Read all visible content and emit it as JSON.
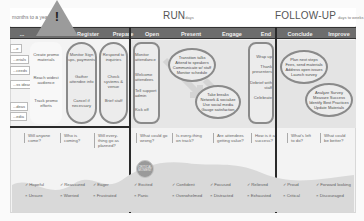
{
  "phases": {
    "plan": {
      "subtitle": "months to a year"
    },
    "run": {
      "title": "RUN",
      "subtitle": "days"
    },
    "followup": {
      "title": "FOLLOW-UP",
      "subtitle": "days to weeks"
    }
  },
  "warning": {
    "symbol": "!"
  },
  "columns": [
    {
      "label": "...",
      "x": 10
    },
    {
      "label": "Pr",
      "x": 40
    },
    {
      "label": "Register",
      "x": 86
    },
    {
      "label": "Prepare",
      "x": 98
    },
    {
      "label": "Open",
      "x": 140
    },
    {
      "label": "Present",
      "x": 172
    },
    {
      "label": "Engage",
      "x": 213
    },
    {
      "label": "End",
      "x": 255
    },
    {
      "label": "Conclude",
      "x": 283
    },
    {
      "label": "Improve",
      "x": 323
    }
  ],
  "left_items": [
    "...e",
    "...erials",
    "...ceeds",
    "...ss ideas",
    "...deas",
    "...edia"
  ],
  "promote_items": [
    "Create promo materials",
    "Reach widest audience",
    "Track promo efforts"
  ],
  "register_items": [
    "Monitor Sign ups, payments",
    "Gather attendee info",
    "Cancel if necessary"
  ],
  "prepare_items": [
    "Respond to inquiries",
    "Check systems & venue",
    "Brief staff"
  ],
  "open_items": [
    "Monitor attendance",
    "Welcome attendees",
    "Tell support admin",
    "Kick off"
  ],
  "present_oval": [
    "Transition talks",
    "Attend to speakers",
    "Communicate w/ staff",
    "Monitor schedule"
  ],
  "engage_oval": [
    "Take breaks",
    "Network & socialize",
    "Use social media",
    "Gauge satisfaction"
  ],
  "end_items": [
    "Wrap up",
    "Thank presenters",
    "Debrief with staff",
    "Celebrate"
  ],
  "conclude_oval": [
    "Plan next steps",
    "Fees, send materials",
    "Address open issues",
    "Launch survey"
  ],
  "improve_oval": [
    "Analyze Survey",
    "Measure Success",
    "Identify Best Practices",
    "Update Materials"
  ],
  "questions": [
    {
      "text": "Will anyone come?",
      "x": 24
    },
    {
      "text": "Who is coming?",
      "x": 60
    },
    {
      "text": "Will every-thing go as planned?",
      "x": 95
    },
    {
      "text": "What could go wrong?",
      "x": 137
    },
    {
      "text": "Is every-thing on track?",
      "x": 172
    },
    {
      "text": "Are attendees getting value?",
      "x": 213
    },
    {
      "text": "How is it a success?",
      "x": 250
    },
    {
      "text": "What's left to do?",
      "x": 287
    },
    {
      "text": "What could be better?",
      "x": 320
    }
  ],
  "badge": {
    "text": "CRITICAL MOMENT"
  },
  "emotions_positive": [
    {
      "text": "Hopeful",
      "x": 24
    },
    {
      "text": "Reassured",
      "x": 60
    },
    {
      "text": "Eager",
      "x": 95
    },
    {
      "text": "Excited",
      "x": 135
    },
    {
      "text": "Confident",
      "x": 172
    },
    {
      "text": "Focused",
      "x": 210
    },
    {
      "text": "Relieved",
      "x": 247
    },
    {
      "text": "Proud",
      "x": 283
    },
    {
      "text": "Forward looking",
      "x": 317
    }
  ],
  "emotions_negative": [
    {
      "text": "Unsure",
      "x": 24
    },
    {
      "text": "Worried",
      "x": 60
    },
    {
      "text": "Frustrated",
      "x": 95
    },
    {
      "text": "Panic",
      "x": 135
    },
    {
      "text": "Overwhelmed",
      "x": 172
    },
    {
      "text": "Distracted",
      "x": 210
    },
    {
      "text": "Exhausted",
      "x": 247
    },
    {
      "text": "Critical",
      "x": 283
    },
    {
      "text": "Discouraged",
      "x": 317
    }
  ],
  "colors": {
    "header_bg": "#6d6d6d",
    "divider": "#2a2a2a",
    "shape_border": "#8a8a8a",
    "panel_bg": "#f3f3f3"
  }
}
